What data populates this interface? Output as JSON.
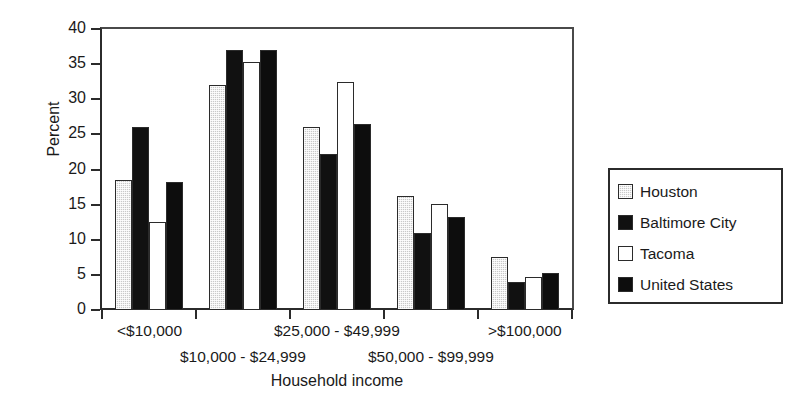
{
  "chart_data": {
    "type": "bar",
    "title": "",
    "xlabel": "Household income",
    "ylabel": "Percent",
    "ylim": [
      0,
      40
    ],
    "yticks": [
      0,
      5,
      10,
      15,
      20,
      25,
      30,
      35,
      40
    ],
    "grid": false,
    "legend_position": "right",
    "categories": [
      "<$10,000",
      "$10,000 - $24,999",
      "$25,000 - $49,999",
      "$50,000 - $99,999",
      ">$100,000"
    ],
    "series": [
      {
        "name": "Houston",
        "color": "#c9c9c9",
        "values": [
          18.5,
          32.0,
          26.0,
          16.2,
          7.5
        ]
      },
      {
        "name": "Baltimore City",
        "color": "#111111",
        "values": [
          26.0,
          37.0,
          22.2,
          10.9,
          4.0
        ]
      },
      {
        "name": "Tacoma",
        "color": "#ffffff",
        "values": [
          12.5,
          35.3,
          32.5,
          15.1,
          4.7
        ]
      },
      {
        "name": "United States",
        "color": "#0d0d0d",
        "values": [
          18.2,
          37.0,
          26.5,
          13.3,
          5.2
        ]
      }
    ]
  },
  "legend": {
    "items": [
      {
        "label": "Houston"
      },
      {
        "label": "Baltimore City"
      },
      {
        "label": "Tacoma"
      },
      {
        "label": "United States"
      }
    ]
  }
}
